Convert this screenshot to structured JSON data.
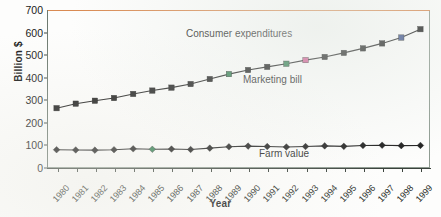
{
  "chart_data": {
    "type": "line",
    "title": "",
    "xlabel": "Year",
    "ylabel": "Billion $",
    "ylim": [
      0,
      700
    ],
    "yticks": [
      0,
      100,
      200,
      300,
      400,
      500,
      600,
      700
    ],
    "grid": false,
    "legend_position": "inline-annotations",
    "categories": [
      "1980",
      "1981",
      "1982",
      "1983",
      "1984",
      "1985",
      "1986",
      "1987",
      "1988",
      "1989",
      "1990",
      "1991",
      "1992",
      "1993",
      "1994",
      "1995",
      "1996",
      "1997",
      "1998",
      "1999"
    ],
    "series": [
      {
        "name": "Marketing bill",
        "marker": "square",
        "color": "#1b1b1b",
        "values": [
          265,
          285,
          298,
          310,
          328,
          343,
          356,
          372,
          394,
          416,
          434,
          448,
          462,
          478,
          492,
          510,
          530,
          552,
          578,
          615
        ]
      },
      {
        "name": "Farm value",
        "marker": "diamond",
        "color": "#1b1b1b",
        "values": [
          81,
          80,
          79,
          81,
          85,
          83,
          84,
          82,
          88,
          94,
          97,
          95,
          93,
          95,
          98,
          96,
          100,
          101,
          99,
          100
        ]
      }
    ],
    "annotations": [
      {
        "id": "consumer",
        "text": "Consumer expenditures"
      },
      {
        "id": "marketing",
        "text": "Marketing bill"
      },
      {
        "id": "farm",
        "text": "Farm value"
      }
    ]
  },
  "colors": {
    "axis": "#3a423c",
    "frame": "#8d9a90",
    "series_line": "#1b1b1b",
    "artifact_rule": "#d98a52",
    "marker_tint_green": "#2f7d4f",
    "marker_tint_magenta": "#d0568f",
    "marker_tint_blue": "#3a4f8a"
  }
}
